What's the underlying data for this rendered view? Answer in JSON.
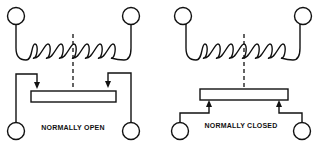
{
  "diagrams": [
    {
      "id": "left",
      "label": "NORMALLY OPEN",
      "contact_arrow_direction": "down"
    },
    {
      "id": "right",
      "label": "NORMALLY CLOSED",
      "contact_arrow_direction": "up"
    }
  ],
  "colors": {
    "line": "#111111",
    "background": "#ffffff"
  }
}
